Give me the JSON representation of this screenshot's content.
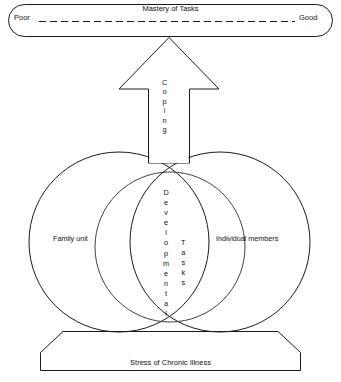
{
  "diagram": {
    "title_visible": false,
    "background_color": "#ffffff",
    "line_color": "#1a1a1a",
    "text_color": "#111111"
  },
  "mastery_bar": {
    "center_label": "Mastery of Tasks",
    "left_anchor": "Poor",
    "right_anchor": "Good",
    "connector_style": "dashed-line",
    "shape": "rounded-rectangle"
  },
  "arrow": {
    "label": "Coping",
    "label_letters": [
      "C",
      "o",
      "p",
      "i",
      "n",
      "g"
    ],
    "direction": "up",
    "shape": "block-arrow"
  },
  "circles": {
    "left": {
      "label": "Family unit"
    },
    "right": {
      "label": "Individual members"
    },
    "overlap": {
      "shape": "lens",
      "labels": [
        {
          "text": "Developmental",
          "letters": [
            "D",
            "e",
            "v",
            "e",
            "l",
            "o",
            "p",
            "m",
            "e",
            "n",
            "t",
            "a",
            "l"
          ]
        },
        {
          "text": "Tasks",
          "letters": [
            "T",
            "a",
            "s",
            "k",
            "s"
          ]
        }
      ]
    }
  },
  "base_banner": {
    "label": "Stress of Chronic Illness",
    "shape": "trapezoid"
  }
}
